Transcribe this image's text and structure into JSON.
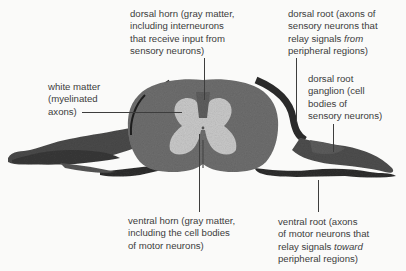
{
  "diagram": {
    "labels": {
      "dorsal_horn": {
        "lines": [
          "dorsal horn (gray matter,",
          "including interneurons",
          "that receive input from",
          "sensory neurons)"
        ]
      },
      "white_matter": {
        "lines": [
          "white matter",
          "(myelinated",
          "axons)"
        ]
      },
      "dorsal_root": {
        "lines": [
          "dorsal root (axons of",
          "sensory neurons that",
          "relay signals ",
          "from",
          "peripheral regions)"
        ]
      },
      "dorsal_root_ganglion": {
        "lines": [
          "dorsal root",
          "ganglion (cell",
          "bodies of",
          "sensory neurons)"
        ]
      },
      "ventral_horn": {
        "lines": [
          "ventral horn (gray matter,",
          "including the cell bodies",
          "of motor neurons)"
        ]
      },
      "ventral_root": {
        "lines": [
          "ventral root (axons",
          "of motor neurons that",
          "relay signals ",
          "toward",
          "peripheral regions)"
        ]
      }
    },
    "colors": {
      "background": "#fafaf9",
      "white_matter": "#6e6e6e",
      "gray_matter": "#c9c9c9",
      "nerve_dark": "#2e2e2e",
      "nerve_mid": "#5a5a5a",
      "text": "#3c3c3c",
      "leader": "#3d3d3d"
    }
  }
}
